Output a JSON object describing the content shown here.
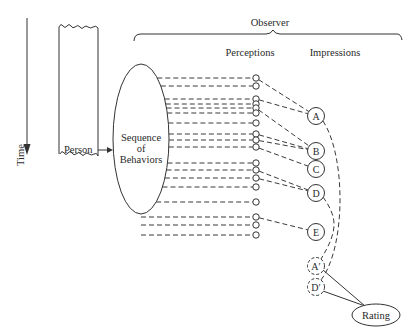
{
  "diagram": {
    "labels": {
      "time": "Time",
      "person": "Person",
      "sequence_line1": "Sequence",
      "sequence_line2": "of",
      "sequence_line3": "Behaviors",
      "observer": "Observer",
      "perceptions": "Perceptions",
      "impressions": "Impressions",
      "rating": "Rating"
    },
    "ellipse": {
      "cx": 141,
      "cy": 139,
      "rx": 28,
      "ry": 75
    },
    "perception_x": 256,
    "perception_nodes_y": [
      78,
      86,
      99,
      104,
      108,
      113,
      123,
      134,
      140,
      147,
      163,
      170,
      178,
      187,
      202,
      217,
      225,
      235
    ],
    "impressions": [
      {
        "id": "A",
        "label": "A",
        "x": 316,
        "y": 116,
        "style": "solid"
      },
      {
        "id": "B",
        "label": "B",
        "x": 316,
        "y": 151,
        "style": "solid"
      },
      {
        "id": "C",
        "label": "C",
        "x": 316,
        "y": 169,
        "style": "solid"
      },
      {
        "id": "D",
        "label": "D",
        "x": 316,
        "y": 193,
        "style": "solid"
      },
      {
        "id": "E",
        "label": "E",
        "x": 316,
        "y": 232,
        "style": "solid"
      },
      {
        "id": "A2",
        "label": "A′",
        "x": 316,
        "y": 266,
        "style": "dashed"
      },
      {
        "id": "D2",
        "label": "D′",
        "x": 316,
        "y": 287,
        "style": "dashed"
      }
    ],
    "node_to_impression": [
      {
        "node_y": 78,
        "to": "A"
      },
      {
        "node_y": 99,
        "to": "A"
      },
      {
        "node_y": 108,
        "to": "B"
      },
      {
        "node_y": 134,
        "to": "B"
      },
      {
        "node_y": 140,
        "to": "B"
      },
      {
        "node_y": 147,
        "to": "C"
      },
      {
        "node_y": 170,
        "to": "D"
      },
      {
        "node_y": 178,
        "to": "D"
      },
      {
        "node_y": 217,
        "to": "E"
      }
    ],
    "memory_links": [
      {
        "from": "A",
        "to": "D2"
      },
      {
        "from": "D",
        "to": "A2"
      }
    ],
    "rating": {
      "cx": 376,
      "cy": 315,
      "rx": 24,
      "ry": 11,
      "inputs": [
        "A2",
        "D2"
      ]
    }
  }
}
